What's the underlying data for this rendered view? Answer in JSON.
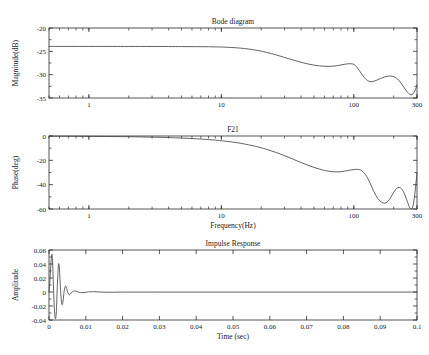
{
  "figure": {
    "background": "#ffffff",
    "line_color": "#3a3a3a",
    "axis_color": "#2b2b2b"
  },
  "chart_data": [
    {
      "type": "line",
      "id": "magnitude",
      "title": "Bode diagram",
      "xlabel": "",
      "ylabel": "Magnitude(dB)",
      "xscale": "log",
      "xlim": [
        0.5,
        300
      ],
      "ylim": [
        -35,
        -20
      ],
      "xticks": [
        1,
        10,
        100,
        300
      ],
      "xticklabels": [
        "1",
        "10",
        "100",
        "300"
      ],
      "yticks": [
        -20,
        -25,
        -30,
        -35
      ],
      "yticklabels": [
        "-20",
        "-25",
        "-30",
        "-35"
      ],
      "grid": false,
      "legend": null,
      "series": [
        {
          "name": "Magnitude",
          "x": [
            0.5,
            0.7,
            1,
            1.5,
            2,
            3,
            4,
            5,
            6,
            7,
            8,
            9,
            10,
            12,
            14,
            16,
            18,
            20,
            24,
            28,
            32,
            36,
            40,
            45,
            50,
            55,
            60,
            65,
            70,
            75,
            80,
            85,
            90,
            95,
            100,
            105,
            110,
            115,
            120,
            125,
            130,
            135,
            140,
            150,
            160,
            170,
            180,
            190,
            200,
            210,
            220,
            230,
            240,
            250,
            260,
            270,
            280,
            290,
            300
          ],
          "y": [
            -23.95,
            -23.95,
            -23.95,
            -23.95,
            -23.96,
            -23.96,
            -23.97,
            -23.98,
            -23.99,
            -24.0,
            -24.02,
            -24.05,
            -24.08,
            -24.18,
            -24.32,
            -24.5,
            -24.72,
            -24.96,
            -25.5,
            -26.05,
            -26.55,
            -26.98,
            -27.35,
            -27.7,
            -27.95,
            -28.12,
            -28.2,
            -28.22,
            -28.18,
            -28.07,
            -27.92,
            -27.78,
            -27.68,
            -27.66,
            -27.8,
            -28.3,
            -29.1,
            -29.9,
            -30.6,
            -31.1,
            -31.4,
            -31.5,
            -31.45,
            -31.15,
            -30.8,
            -30.5,
            -30.35,
            -30.3,
            -30.42,
            -30.75,
            -31.3,
            -32.0,
            -32.8,
            -33.5,
            -34.05,
            -34.3,
            -34.1,
            -33.4,
            -32.2
          ]
        }
      ]
    },
    {
      "type": "line",
      "id": "phase",
      "title": "F21",
      "xlabel": "Frequency(Hz)",
      "ylabel": "Phase(deg)",
      "xscale": "log",
      "xlim": [
        0.5,
        300
      ],
      "ylim": [
        -60,
        0
      ],
      "xticks": [
        1,
        10,
        100,
        300
      ],
      "xticklabels": [
        "1",
        "10",
        "100",
        "300"
      ],
      "yticks": [
        0,
        -20,
        -40,
        -60
      ],
      "yticklabels": [
        "0",
        "-20",
        "-40",
        "-60"
      ],
      "grid": false,
      "legend": null,
      "series": [
        {
          "name": "Phase",
          "x": [
            0.5,
            0.7,
            1,
            1.5,
            2,
            3,
            4,
            5,
            6,
            7,
            8,
            9,
            10,
            12,
            14,
            16,
            18,
            20,
            24,
            28,
            32,
            36,
            40,
            45,
            50,
            55,
            60,
            65,
            70,
            75,
            80,
            85,
            90,
            95,
            100,
            105,
            110,
            115,
            120,
            125,
            130,
            135,
            140,
            150,
            160,
            170,
            180,
            190,
            200,
            210,
            220,
            230,
            240,
            250,
            260,
            270,
            280,
            290,
            300
          ],
          "y": [
            -0.15,
            -0.2,
            -0.3,
            -0.45,
            -0.6,
            -0.95,
            -1.3,
            -1.7,
            -2.1,
            -2.5,
            -2.95,
            -3.4,
            -3.9,
            -4.9,
            -6.0,
            -7.2,
            -8.4,
            -9.7,
            -12.3,
            -14.9,
            -17.4,
            -19.7,
            -21.8,
            -24.0,
            -25.8,
            -27.2,
            -28.3,
            -29.0,
            -29.4,
            -29.5,
            -29.3,
            -28.9,
            -28.4,
            -27.9,
            -27.6,
            -27.4,
            -27.6,
            -28.6,
            -30.5,
            -33.2,
            -36.6,
            -40.5,
            -44.5,
            -50.5,
            -54.0,
            -55.2,
            -54.0,
            -50.5,
            -46.3,
            -43.2,
            -42.3,
            -43.5,
            -47.0,
            -52.0,
            -57.0,
            -60.0,
            -57.5,
            -46.0,
            -30.5
          ]
        }
      ]
    },
    {
      "type": "line",
      "id": "impulse",
      "title": "Impulse Response",
      "xlabel": "Time (sec)",
      "ylabel": "Amplitude",
      "xscale": "linear",
      "xlim": [
        0,
        0.1
      ],
      "ylim": [
        -0.04,
        0.06
      ],
      "xticks": [
        0,
        0.01,
        0.02,
        0.03,
        0.04,
        0.05,
        0.06,
        0.07,
        0.08,
        0.09,
        0.1
      ],
      "xticklabels": [
        "0",
        "0.01",
        "0.02",
        "0.03",
        "0.04",
        "0.05",
        "0.06",
        "0.07",
        "0.08",
        "0.09",
        "0.1"
      ],
      "yticks": [
        0.06,
        0.04,
        0.02,
        0,
        -0.02,
        -0.04
      ],
      "yticklabels": [
        "0.06",
        "0.04",
        "0.02",
        "0",
        "-0.02",
        "-0.04"
      ],
      "grid": false,
      "legend": null,
      "series": [
        {
          "name": "Impulse",
          "x": [
            0,
            0.0002,
            0.0004,
            0.0006,
            0.0008,
            0.001,
            0.0012,
            0.0014,
            0.0016,
            0.0018,
            0.002,
            0.0022,
            0.0024,
            0.0026,
            0.0028,
            0.003,
            0.0032,
            0.0034,
            0.0036,
            0.0038,
            0.004,
            0.0042,
            0.0044,
            0.0046,
            0.0048,
            0.005,
            0.0052,
            0.0055,
            0.0058,
            0.006,
            0.0063,
            0.0066,
            0.007,
            0.0074,
            0.0078,
            0.0082,
            0.0086,
            0.009,
            0.0095,
            0.01,
            0.0105,
            0.011,
            0.0118,
            0.0125,
            0.0135,
            0.0145,
            0.0155,
            0.017,
            0.019,
            0.021,
            0.024,
            0.027,
            0.03,
            0.035,
            0.04,
            0.05,
            0.06,
            0.07,
            0.08,
            0.09,
            0.1
          ],
          "y": [
            0,
            0.012,
            0.03,
            0.046,
            0.054,
            0.04,
            0.01,
            -0.018,
            -0.034,
            -0.038,
            -0.028,
            0.0,
            0.024,
            0.04,
            0.036,
            0.018,
            -0.002,
            -0.015,
            -0.018,
            -0.013,
            -0.004,
            0.004,
            0.008,
            0.008,
            0.005,
            0.001,
            -0.002,
            -0.004,
            -0.003,
            -0.0015,
            0.0,
            0.0012,
            0.0016,
            0.0012,
            0.0004,
            -0.0004,
            -0.0009,
            -0.001,
            -0.0008,
            -0.0004,
            0.0,
            0.0003,
            0.0005,
            0.0004,
            0.0001,
            -0.0002,
            -0.0003,
            -0.0003,
            -0.0002,
            -0.0001,
            -0.0001,
            -0.0001,
            -0.0001,
            -0.0001,
            -0.0001,
            -0.0001,
            -0.0001,
            -0.0001,
            -0.0001,
            -0.0001,
            -0.0001
          ]
        }
      ]
    }
  ]
}
